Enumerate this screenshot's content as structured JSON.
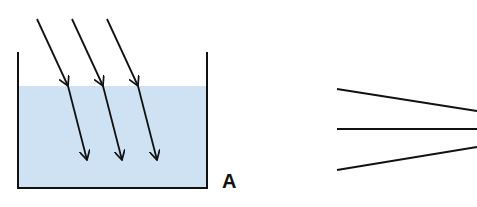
{
  "figure": {
    "left_diagram": {
      "label": "A",
      "description": "Parallel light rays entering water in a container and refracting",
      "water_color": "#cfe2f3",
      "line_color": "#111111",
      "container": {
        "left_x": 18,
        "right_x": 207,
        "top_y": 52,
        "bottom_y": 188,
        "water_top_y": 86
      },
      "rays": [
        {
          "start": [
            37,
            19
          ],
          "refract": [
            68,
            86
          ],
          "end": [
            87,
            160
          ]
        },
        {
          "start": [
            72,
            19
          ],
          "refract": [
            103,
            86
          ],
          "end": [
            122,
            160
          ]
        },
        {
          "start": [
            107,
            19
          ],
          "refract": [
            138,
            86
          ],
          "end": [
            157,
            160
          ]
        }
      ]
    },
    "right_diagram": {
      "description": "Three lines converging to a focal point and diverging",
      "focus": [
        444,
        129
      ],
      "lines": [
        {
          "from": [
            337,
            89
          ],
          "to": [
            477,
            111
          ]
        },
        {
          "from": [
            337,
            129
          ],
          "to": [
            477,
            129
          ]
        },
        {
          "from": [
            337,
            170
          ],
          "to": [
            477,
            147
          ]
        }
      ]
    }
  }
}
